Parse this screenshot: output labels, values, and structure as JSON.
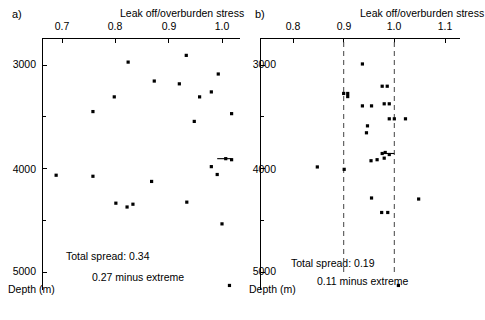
{
  "figure": {
    "width": 485,
    "height": 320,
    "background": "#ffffff",
    "ink_color": "#000000",
    "reference_line_color": "#555555"
  },
  "chart_data": [
    {
      "type": "scatter",
      "panel_label": "a)",
      "title": "",
      "xlabel": "Leak off/overburden stress",
      "ylabel": "Depth (m)",
      "xlim": [
        0.655,
        1.03
      ],
      "ylim": [
        5250,
        2700
      ],
      "y_inverted": true,
      "grid": false,
      "legend": null,
      "xticks": [
        0.7,
        0.8,
        0.9,
        1.0
      ],
      "xticklabels": [
        "0.7",
        "0.8",
        "0.9",
        "1.0"
      ],
      "yticks": [
        3000,
        3500,
        4000,
        4500,
        5000
      ],
      "yticklabels": [
        "3000",
        "",
        "4000",
        "",
        "5000"
      ],
      "x_axis_position": "top",
      "annotations": [
        "Total spread: 0.34",
        "0.27 minus extreme"
      ],
      "points": [
        {
          "x": 0.824,
          "y": 2972
        },
        {
          "x": 0.873,
          "y": 3155
        },
        {
          "x": 0.798,
          "y": 3308
        },
        {
          "x": 0.758,
          "y": 3450
        },
        {
          "x": 0.933,
          "y": 2907
        },
        {
          "x": 0.993,
          "y": 3087
        },
        {
          "x": 0.92,
          "y": 3182
        },
        {
          "x": 0.98,
          "y": 3260
        },
        {
          "x": 0.958,
          "y": 3308
        },
        {
          "x": 1.018,
          "y": 3470
        },
        {
          "x": 0.948,
          "y": 3545
        },
        {
          "x": 1.007,
          "y": 3905
        },
        {
          "x": 0.98,
          "y": 3982
        },
        {
          "x": 0.991,
          "y": 4058
        },
        {
          "x": 1.018,
          "y": 3915
        },
        {
          "x": 0.689,
          "y": 4065
        },
        {
          "x": 0.758,
          "y": 4075
        },
        {
          "x": 0.868,
          "y": 4125
        },
        {
          "x": 0.801,
          "y": 4335
        },
        {
          "x": 0.822,
          "y": 4372
        },
        {
          "x": 0.833,
          "y": 4345
        },
        {
          "x": 0.934,
          "y": 4325
        },
        {
          "x": 1.0,
          "y": 4535
        },
        {
          "x": 1.014,
          "y": 5130
        }
      ],
      "connector_lines": [
        {
          "x1": 0.991,
          "y1": 3905,
          "x2": 1.018,
          "y2": 3905
        }
      ]
    },
    {
      "type": "scatter",
      "panel_label": "b)",
      "title": "",
      "xlabel": "Leak off/overburden stress",
      "ylabel": "Depth (m)",
      "xlim": [
        0.762,
        1.135
      ],
      "ylim": [
        5250,
        2700
      ],
      "y_inverted": true,
      "grid": false,
      "legend": null,
      "xticks": [
        0.8,
        0.9,
        1.0,
        1.1
      ],
      "xticklabels": [
        "0.8",
        "0.9",
        "1.0",
        "1.1"
      ],
      "yticks": [
        3000,
        3500,
        4000,
        4500,
        5000
      ],
      "yticklabels": [
        "3000",
        "",
        "4000",
        "",
        "5000"
      ],
      "x_axis_position": "top",
      "reference_lines": [
        0.9,
        1.0
      ],
      "annotations": [
        "Total spread: 0.19",
        "0.11 minus extreme"
      ],
      "points": [
        {
          "x": 0.937,
          "y": 2990
        },
        {
          "x": 0.976,
          "y": 3205
        },
        {
          "x": 0.986,
          "y": 3205
        },
        {
          "x": 0.9,
          "y": 3275
        },
        {
          "x": 0.908,
          "y": 3275
        },
        {
          "x": 0.908,
          "y": 3305
        },
        {
          "x": 0.98,
          "y": 3375
        },
        {
          "x": 0.99,
          "y": 3375
        },
        {
          "x": 0.937,
          "y": 3395
        },
        {
          "x": 0.955,
          "y": 3395
        },
        {
          "x": 0.99,
          "y": 3520
        },
        {
          "x": 1.0,
          "y": 3520
        },
        {
          "x": 1.022,
          "y": 3520
        },
        {
          "x": 0.947,
          "y": 3588
        },
        {
          "x": 0.945,
          "y": 3655
        },
        {
          "x": 0.976,
          "y": 3855
        },
        {
          "x": 0.982,
          "y": 3845
        },
        {
          "x": 0.99,
          "y": 3865
        },
        {
          "x": 0.954,
          "y": 3925
        },
        {
          "x": 0.966,
          "y": 3915
        },
        {
          "x": 0.98,
          "y": 3900
        },
        {
          "x": 0.848,
          "y": 3985
        },
        {
          "x": 0.901,
          "y": 4008
        },
        {
          "x": 0.955,
          "y": 4285
        },
        {
          "x": 1.048,
          "y": 4295
        },
        {
          "x": 0.975,
          "y": 4425
        },
        {
          "x": 0.987,
          "y": 4425
        },
        {
          "x": 1.008,
          "y": 5130
        }
      ],
      "connector_lines": [
        {
          "x1": 0.976,
          "y1": 3855,
          "x2": 1.0,
          "y2": 3855
        }
      ]
    }
  ]
}
